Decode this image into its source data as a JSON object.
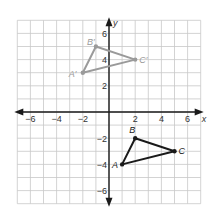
{
  "diagram": {
    "type": "coordinate-plane",
    "x_axis_label": "x",
    "y_axis_label": "y",
    "range": {
      "xmin": -7,
      "xmax": 7,
      "ymin": -7,
      "ymax": 7
    },
    "x_ticks": [
      {
        "value": -6,
        "label": "−6"
      },
      {
        "value": -4,
        "label": "−4"
      },
      {
        "value": -2,
        "label": "−2"
      },
      {
        "value": 2,
        "label": "2"
      },
      {
        "value": 4,
        "label": "4"
      },
      {
        "value": 6,
        "label": "6"
      }
    ],
    "y_ticks": [
      {
        "value": 6,
        "label": "6"
      },
      {
        "value": 4,
        "label": "4"
      },
      {
        "value": 2,
        "label": "2"
      },
      {
        "value": -2,
        "label": "−2"
      },
      {
        "value": -4,
        "label": "−4"
      },
      {
        "value": -6,
        "label": "−6"
      }
    ],
    "colors": {
      "grid": "#c8c8c8",
      "axis": "#1a1a1a",
      "image_triangle": "#9a9a9a",
      "original_triangle": "#1a1a1a"
    },
    "triangles": [
      {
        "name": "original",
        "color": "#1a1a1a",
        "points": [
          {
            "label": "A",
            "x": 1,
            "y": -4,
            "label_dx": -10,
            "label_dy": 4
          },
          {
            "label": "B",
            "x": 2,
            "y": -2,
            "label_dx": -6,
            "label_dy": -5
          },
          {
            "label": "C",
            "x": 5,
            "y": -3,
            "label_dx": 4,
            "label_dy": 3
          }
        ]
      },
      {
        "name": "image",
        "color": "#9a9a9a",
        "points": [
          {
            "label": "A′",
            "x": -2,
            "y": 3,
            "label_dx": -14,
            "label_dy": 4
          },
          {
            "label": "B′",
            "x": -1,
            "y": 5,
            "label_dx": -9,
            "label_dy": -2
          },
          {
            "label": "C′",
            "x": 2,
            "y": 4,
            "label_dx": 4,
            "label_dy": 3
          }
        ]
      }
    ]
  }
}
